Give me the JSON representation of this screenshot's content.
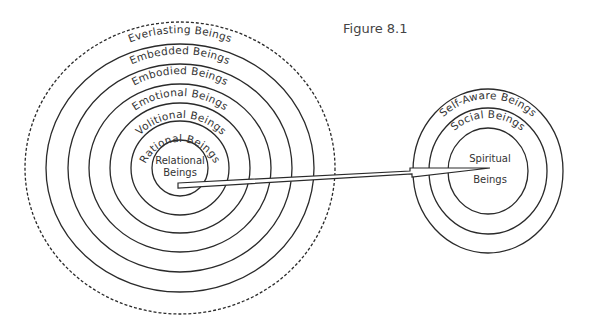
{
  "figure": {
    "title": "Figure 8.1"
  },
  "left_diagram": {
    "center_label_line1": "Relational",
    "center_label_line2": "Beings",
    "rings": [
      {
        "label": "Rational Beings"
      },
      {
        "label": "Volitional Beings"
      },
      {
        "label": "Emotional Beings"
      },
      {
        "label": "Embodied Beings"
      },
      {
        "label": "Embedded Beings"
      },
      {
        "label": "Everlasting Beings",
        "border": "dashed"
      }
    ]
  },
  "right_diagram": {
    "center_label_line1": "Spiritual",
    "center_label_line2": "Beings",
    "rings": [
      {
        "label": "Social Beings"
      },
      {
        "label": "Self-Aware Beings"
      }
    ]
  },
  "arrow": {
    "from": "Relational Beings",
    "to": "Spiritual Beings"
  }
}
